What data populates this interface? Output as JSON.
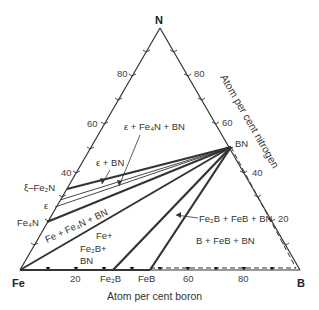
{
  "diagram": {
    "vertices": {
      "top": "N",
      "left": "Fe",
      "right": "B"
    },
    "axis_labels": {
      "bottom": "Atom per cent boron",
      "right": "Atom per cent nitrogen"
    },
    "left_edge_ticks": [
      "80",
      "60",
      "40"
    ],
    "right_edge_ticks": [
      "80",
      "60",
      "40",
      "20"
    ],
    "bottom_edge_ticks": [
      "20",
      "60",
      "80"
    ],
    "compounds": {
      "bn": "BN",
      "xi_fe2n": "ξ–Fe₂N",
      "epsilon": "ε",
      "fe4n": "Fe₄N",
      "fe2b": "Fe₂B",
      "feb": "FeB"
    },
    "phase_regions": {
      "eps_fe4n_bn": "ε + Fe₄N + BN",
      "eps_bn": "ε + BN",
      "fe_fe4n_bn": "Fe + Fe₄N + BN",
      "fe_fe2b_bn_line1": "Fe+",
      "fe_fe2b_bn_line2": "Fe₂B+",
      "fe_fe2b_bn_line3": "BN",
      "fe2b_feb_bn": "Fe₂B + FeB + BN",
      "b_feb_bn": "B + FeB + BN"
    },
    "colors": {
      "line": "#333333",
      "text": "#333333"
    }
  }
}
